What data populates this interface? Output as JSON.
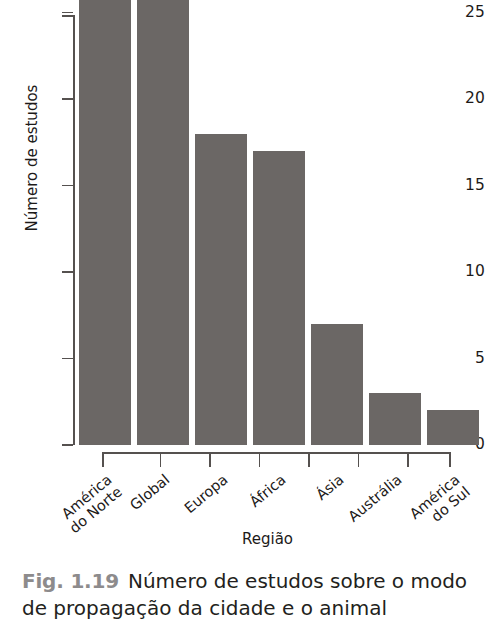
{
  "chart_data": {
    "type": "bar",
    "title": "",
    "xlabel": "Região",
    "ylabel": "Número de estudos",
    "categories": [
      "América\ndo Norte",
      "Global",
      "Europa",
      "África",
      "Ásia",
      "Austrália",
      "América\ndo Sul"
    ],
    "values": [
      29,
      29,
      18,
      17,
      7,
      3,
      2
    ],
    "value_notes": "Os dois primeiros valores estão cortados no topo da imagem (acima de 25).",
    "ylim": [
      0,
      26
    ],
    "yticks": [
      0,
      5,
      10,
      15,
      20,
      25
    ],
    "ytick_labels": [
      "0",
      "5",
      "10",
      "15",
      "20",
      "25"
    ],
    "grid": false,
    "legend": "none",
    "bar_color": "#6b6765",
    "axis_color": "#55514f",
    "text_color": "#1d1a19"
  },
  "caption": {
    "figure_number": "Fig. 1.19",
    "line1": "Número de estudos sobre o modo",
    "line2": "de propagação da cidade e o animal"
  }
}
